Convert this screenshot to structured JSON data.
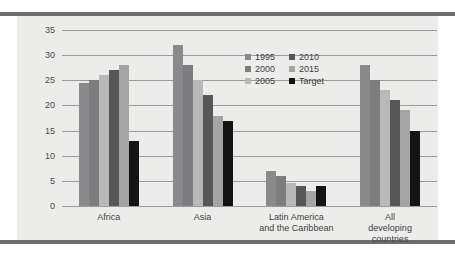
{
  "chart_data": {
    "type": "bar",
    "title": "",
    "subtitle": "",
    "xlabel": "",
    "ylabel": "",
    "ylim": [
      0,
      35
    ],
    "yticks": [
      0,
      5,
      10,
      15,
      20,
      25,
      30,
      35
    ],
    "grid": true,
    "legend_position": "inside-top-center",
    "categories": [
      "Africa",
      "Asia",
      "Latin America\nand the Caribbean",
      "All developing\ncountries"
    ],
    "series": [
      {
        "name": "1995",
        "color": "#8a8a8c",
        "values": [
          24.5,
          32,
          7,
          28
        ]
      },
      {
        "name": "2000",
        "color": "#7d7d7f",
        "values": [
          25,
          28,
          6,
          25
        ]
      },
      {
        "name": "2005",
        "color": "#b9b9b8",
        "values": [
          26,
          25,
          4.5,
          23
        ]
      },
      {
        "name": "2010",
        "color": "#57575a",
        "values": [
          27,
          22,
          4,
          21
        ]
      },
      {
        "name": "2015",
        "color": "#a5a5a5",
        "values": [
          28,
          18,
          3,
          19
        ]
      },
      {
        "name": "Target",
        "color": "#141414",
        "values": [
          13,
          17,
          4,
          15
        ]
      }
    ]
  },
  "colors": {
    "panel_background": "#ececeb",
    "figure_background": "#ffffff",
    "rule": "#6e6e70",
    "gridline": "#9a9a9c",
    "tick_text": "#4a4a4c",
    "label_text": "#3f3f41"
  }
}
